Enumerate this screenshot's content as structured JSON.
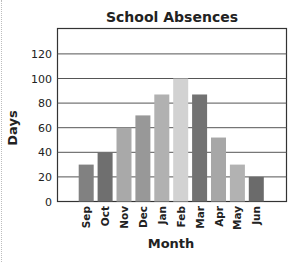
{
  "chart_data": {
    "type": "bar",
    "title": "School Absences",
    "xlabel": "Month",
    "ylabel": "Days",
    "categories": [
      "Sep",
      "Oct",
      "Nov",
      "Dec",
      "Jan",
      "Feb",
      "Mar",
      "Apr",
      "May",
      "Jun"
    ],
    "values": [
      30,
      40,
      60,
      70,
      87,
      100,
      87,
      52,
      30,
      20
    ],
    "bar_colors": [
      "#818181",
      "#6f6f6f",
      "#a9a9a9",
      "#989898",
      "#b1b1b1",
      "#d2d2d2",
      "#727272",
      "#a7a7a7",
      "#b2b2b2",
      "#6b6b6b"
    ],
    "ylim": [
      0,
      140
    ],
    "yticks": [
      0,
      20,
      40,
      60,
      80,
      100,
      120
    ],
    "grid": true,
    "legend": "none"
  }
}
